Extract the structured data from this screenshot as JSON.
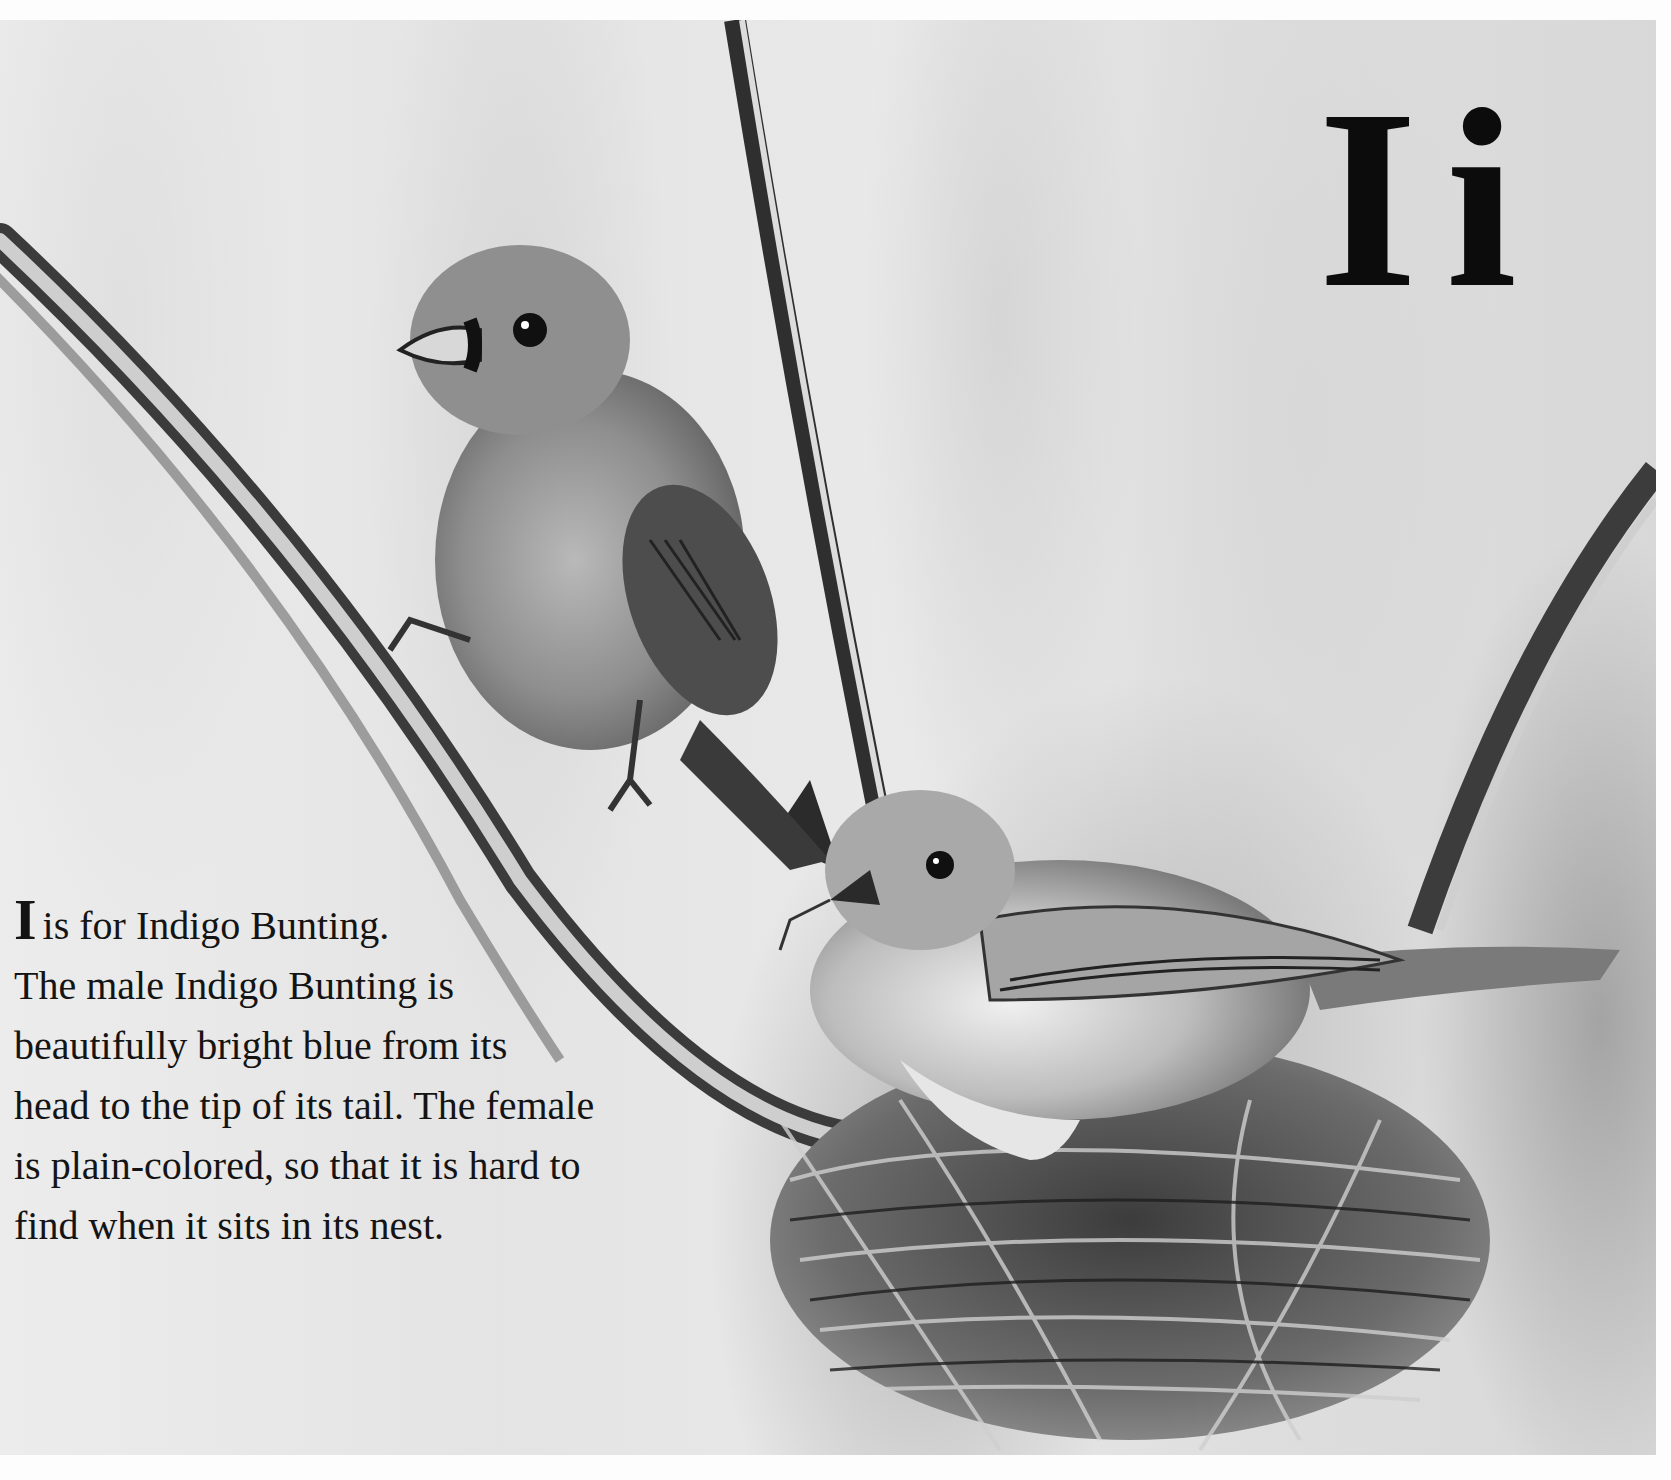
{
  "page": {
    "letter_pair": {
      "upper": "I",
      "lower": "i"
    },
    "caption": {
      "drop_cap": "I",
      "first_line_rest": "is for Indigo Bunting.",
      "lines": [
        "The male Indigo Bunting is",
        "beautifully bright blue from its",
        "head to the tip of its tail. The female",
        "is plain-colored, so that it is hard to",
        "find when it sits in its nest."
      ]
    },
    "illustration": {
      "subject": "Two Indigo Buntings: male perched on a reed, female sitting on a woven nest",
      "style": "grayscale watercolor and ink",
      "elements": [
        "reed-stalk-left",
        "reed-stalk-center",
        "reed-stalk-right",
        "male-indigo-bunting",
        "female-indigo-bunting",
        "grass-nest"
      ]
    },
    "colors": {
      "background": "#fdfdfd",
      "text": "#141414",
      "letter": "#0c0c0c",
      "wash_light": "#e6e6e6",
      "wash_dark": "#8a8a8a"
    }
  }
}
